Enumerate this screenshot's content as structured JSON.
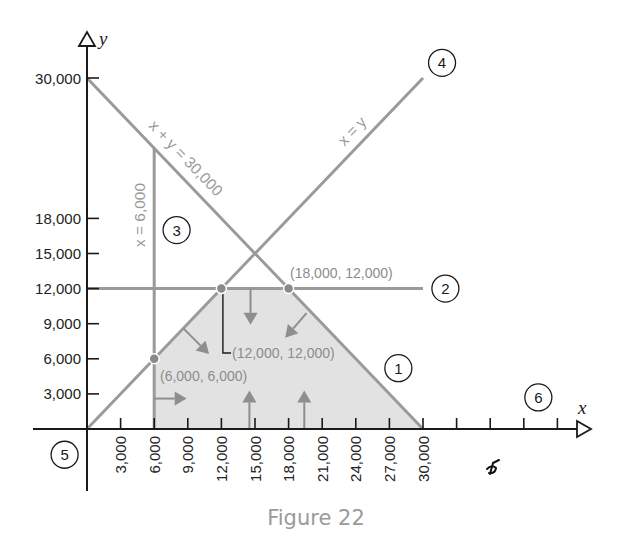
{
  "figure": {
    "caption": "Figure 22"
  },
  "chart_data": {
    "type": "line",
    "title": "Figure 22",
    "xlabel": "x",
    "ylabel": "y",
    "xlim": [
      0,
      42000
    ],
    "ylim": [
      0,
      30000
    ],
    "grid": false,
    "legend": null,
    "x_axis": {
      "ticks": [
        3000,
        6000,
        9000,
        12000,
        15000,
        18000,
        21000,
        24000,
        27000,
        30000,
        33000,
        36000,
        39000,
        42000
      ],
      "tick_labels": [
        "3,000",
        "6,000",
        "9,000",
        "12,000",
        "15,000",
        "18,000",
        "21,000",
        "24,000",
        "27,000",
        "30,000"
      ]
    },
    "y_axis": {
      "ticks": [
        3000,
        6000,
        9000,
        12000,
        15000,
        18000,
        30000
      ],
      "tick_labels": [
        "3,000",
        "6,000",
        "9,000",
        "12,000",
        "15,000",
        "18,000",
        "30,000"
      ]
    },
    "constraint_lines": [
      {
        "id": "1",
        "equation": "x + y = 30,000",
        "from": [
          0,
          30000
        ],
        "to": [
          30000,
          0
        ],
        "label": "x + y = 30,000"
      },
      {
        "id": "2",
        "equation": "y = 12,000",
        "from": [
          0,
          12000
        ],
        "to": [
          30000,
          12000
        ]
      },
      {
        "id": "3",
        "equation": "x = 6,000",
        "from": [
          6000,
          0
        ],
        "to": [
          6000,
          24000
        ],
        "label": "x = 6,000"
      },
      {
        "id": "4",
        "equation": "x = y",
        "from": [
          0,
          0
        ],
        "to": [
          30000,
          30000
        ],
        "label": "x = y"
      }
    ],
    "feasible_region": {
      "vertices": [
        [
          6000,
          0
        ],
        [
          6000,
          6000
        ],
        [
          12000,
          12000
        ],
        [
          18000,
          12000
        ],
        [
          30000,
          0
        ]
      ]
    },
    "corner_points": [
      {
        "x": 6000,
        "y": 6000,
        "label": "(6,000, 6,000)"
      },
      {
        "x": 12000,
        "y": 12000,
        "label": "(12,000, 12,000)"
      },
      {
        "x": 18000,
        "y": 12000,
        "label": "(18,000, 12,000)"
      }
    ],
    "direction_arrows": [
      {
        "constraint": "4",
        "from": [
          8600,
          8600
        ],
        "to": [
          10900,
          6400
        ]
      },
      {
        "constraint": "2",
        "from": [
          14600,
          12000
        ],
        "to": [
          14600,
          8900
        ]
      },
      {
        "constraint": "1",
        "from": [
          19600,
          9900
        ],
        "to": [
          17700,
          7800
        ]
      },
      {
        "constraint": "3",
        "from": [
          6000,
          2600
        ],
        "to": [
          8900,
          2600
        ]
      },
      {
        "constraint": "6",
        "from": [
          14500,
          0
        ],
        "to": [
          14500,
          3300
        ]
      },
      {
        "constraint": "6",
        "from": [
          19400,
          0
        ],
        "to": [
          19400,
          3300
        ]
      }
    ],
    "constraint_markers": [
      {
        "number": "1",
        "at": [
          27800,
          5200
        ]
      },
      {
        "number": "2",
        "at": [
          32000,
          12000
        ]
      },
      {
        "number": "3",
        "at": [
          8000,
          17000
        ]
      },
      {
        "number": "4",
        "at": [
          31700,
          31300
        ]
      },
      {
        "number": "5",
        "at": [
          -2000,
          -2200
        ]
      },
      {
        "number": "6",
        "at": [
          40300,
          2700
        ]
      }
    ],
    "colors": {
      "axis": "#1a1a1a",
      "constraint_line": "#9a9a9a",
      "region": "#e2e2e2",
      "arrow": "#8e8e8e",
      "point": "#8a8a8a"
    }
  }
}
